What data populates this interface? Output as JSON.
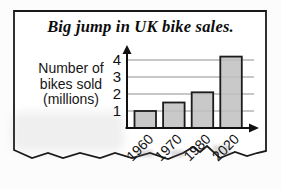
{
  "figure": {
    "title": "Big jump in UK bike sales.",
    "ylabel_lines": [
      "Number of",
      "bikes sold",
      "(millions)"
    ]
  },
  "chart_data": {
    "type": "bar",
    "title": "Big jump in UK bike sales.",
    "categories": [
      "1960",
      "1970",
      "1980",
      "2020"
    ],
    "values": [
      1,
      1.5,
      2.1,
      4.2
    ],
    "xlabel": "",
    "ylabel": "Number of bikes sold (millions)",
    "yticks": [
      1,
      2,
      3,
      4
    ],
    "ylim": [
      0,
      4.5
    ],
    "grid": true,
    "legend": "none",
    "colors": {
      "bar_fill": "#bfbfbf",
      "bar_border": "#1c1c1c",
      "axis": "#111111",
      "grid": "#8f8f8f",
      "text": "#111111"
    }
  }
}
